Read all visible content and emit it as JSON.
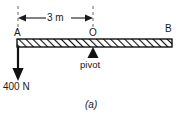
{
  "figure": {
    "caption": "(a)",
    "type": "beam-lever-free-body-diagram",
    "background_color": "#ffffff",
    "line_color": "#1a1a1a"
  },
  "points": {
    "a_label": "A",
    "o_label": "O",
    "b_label": "B"
  },
  "dimension": {
    "label": "3 m",
    "from": "A",
    "to": "O"
  },
  "force": {
    "label": "400 N",
    "direction": "down",
    "applied_at": "A"
  },
  "support": {
    "label": "pivot",
    "located_at": "O"
  },
  "beam": {
    "hatch_pattern": "diagonal",
    "fill_color": "#ffffff",
    "edge_color": "#000000"
  }
}
